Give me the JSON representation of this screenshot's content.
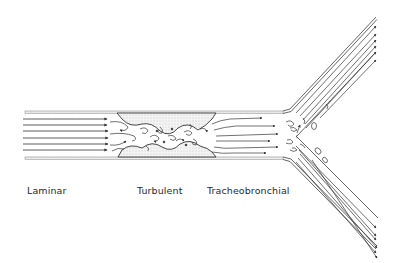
{
  "figure": {
    "labels": {
      "laminar": "Laminar",
      "turbulent": "Turbulent",
      "tracheobronchial": "Tracheobronchial"
    },
    "regions": [
      {
        "name": "laminar",
        "flow": "parallel streamlines with arrows"
      },
      {
        "name": "turbulent",
        "flow": "eddies past irregular narrowing"
      },
      {
        "name": "tracheobronchial",
        "flow": "bifurcation into two branches with eddies at carina"
      }
    ],
    "colors": {
      "line": "#3a3a3a",
      "wall_stipple": "#9a9a9a",
      "background": "#ffffff"
    }
  }
}
